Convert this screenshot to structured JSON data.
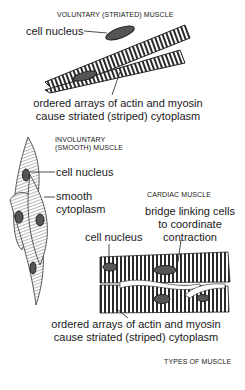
{
  "diagram": {
    "title": "TYPES OF MUSCLE",
    "sections": {
      "voluntary": {
        "heading": "VOLUNTARY (STRIATED) MUSCLE",
        "nucleus_label": "cell nucleus",
        "striation_line1": "ordered arrays of actin and myosin",
        "striation_line2": "cause striated (striped) cytoplasm"
      },
      "involuntary": {
        "heading_line1": "INVOLUNTARY",
        "heading_line2": "(SMOOTH) MUSCLE",
        "nucleus_label": "cell nucleus",
        "cytoplasm_line1": "smooth",
        "cytoplasm_line2": "cytoplasm"
      },
      "cardiac": {
        "heading": "CARDIAC MUSCLE",
        "bridge_line1": "bridge linking cells",
        "bridge_line2": "to coordinate",
        "bridge_line3": "contraction",
        "nucleus_label": "cell nucleus",
        "striation_line1": "ordered arrays of actin and myosin",
        "striation_line2": "cause striated (striped) cytoplasm"
      }
    },
    "colors": {
      "ink": "#1a1a1a",
      "nucleus": "#555555",
      "background": "#ffffff"
    }
  }
}
